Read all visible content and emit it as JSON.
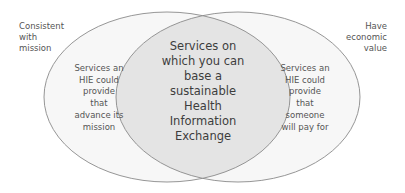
{
  "diagram": {
    "type": "venn",
    "colors": {
      "outer_fill": "#f7f7f7",
      "overlap_fill": "#e4e4e4",
      "stroke": "#8a8a8a",
      "text": "#4a4a4a"
    },
    "sets": [
      {
        "name": "Consistent with mission",
        "outer_label": "Consistent with mission",
        "outer_label_lines": [
          "Consistent",
          "with",
          "mission"
        ],
        "inner_label_lines": [
          "Services an",
          "HIE could",
          "provide",
          "that",
          "advance its",
          "mission"
        ]
      },
      {
        "name": "Have economic value",
        "outer_label": "Have economic value",
        "outer_label_lines": [
          "Have",
          "economic",
          "value"
        ],
        "inner_label_lines": [
          "Services an",
          "HIE could",
          "provide",
          "that",
          "someone",
          "will pay for"
        ]
      }
    ],
    "intersection": {
      "label_lines": [
        "Services on",
        "which you can",
        "base a",
        "sustainable",
        "Health",
        "Information",
        "Exchange"
      ]
    }
  }
}
